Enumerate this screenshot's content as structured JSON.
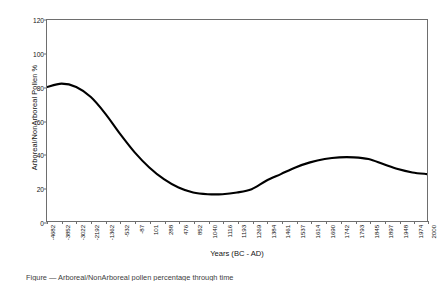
{
  "chart_data": {
    "type": "line",
    "title": "",
    "xlabel": "Years (BC - AD)",
    "ylabel": "Arboreal/NonArboreal Pollen %",
    "ylim": [
      0,
      120
    ],
    "yticks": [
      0,
      20,
      40,
      60,
      80,
      100,
      120
    ],
    "grid": false,
    "legend": null,
    "line_color": "#000000",
    "categories": [
      "-4682",
      "-3852",
      "-3022",
      "-2192",
      "-1362",
      "-532",
      "-87",
      "101",
      "288",
      "476",
      "852",
      "1040",
      "1116",
      "1193",
      "1269",
      "1384",
      "1461",
      "1537",
      "1614",
      "1690",
      "1742",
      "1793",
      "1845",
      "1897",
      "1948",
      "1974",
      "2000"
    ],
    "series": [
      {
        "name": "Arboreal/NonArboreal Pollen %",
        "values": [
          80,
          82,
          80,
          74,
          64,
          52,
          41,
          32,
          25,
          20,
          17,
          16,
          16,
          17,
          19,
          24,
          28,
          32,
          35,
          37,
          38,
          38,
          37,
          34,
          31,
          29,
          28
        ]
      }
    ],
    "annotations": {
      "initial_peak": {
        "x": "-3852",
        "y": 82
      },
      "minimum": {
        "x": "1040",
        "y": 16
      },
      "secondary_peak": {
        "x": "1742",
        "y": 38
      },
      "final_value": {
        "x": "2000",
        "y": 28
      }
    }
  },
  "caption": {
    "text": "Figure  —  Arboreal/NonArboreal pollen percentage through time"
  }
}
